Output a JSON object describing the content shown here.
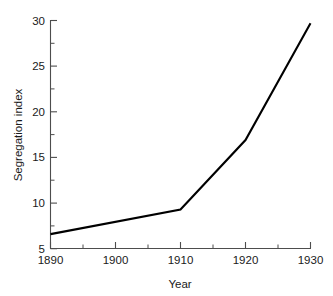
{
  "chart_data": {
    "type": "line",
    "title": "",
    "xlabel": "Year",
    "ylabel": "Segregation index",
    "x": [
      1890,
      1900,
      1910,
      1920,
      1930
    ],
    "series": [
      {
        "name": "Segregation index",
        "x": [
          1890,
          1910,
          1920,
          1930
        ],
        "values": [
          6.6,
          9.3,
          16.9,
          29.7
        ],
        "color": "#000000"
      }
    ],
    "xlim": [
      1890,
      1930
    ],
    "ylim": [
      5,
      30
    ],
    "xticks": [
      1890,
      1900,
      1910,
      1920,
      1930
    ],
    "yticks": [
      5,
      10,
      15,
      20,
      25,
      30
    ],
    "xtick_labels": [
      "1890",
      "1900",
      "1910",
      "1920",
      "1930"
    ],
    "ytick_labels": [
      "5",
      "10",
      "15",
      "20",
      "25",
      "30"
    ],
    "x_minor_ticks": [
      1895,
      1905,
      1915,
      1925
    ],
    "y_minor_ticks": [
      7.5,
      12.5,
      17.5,
      22.5,
      27.5
    ],
    "grid": false,
    "legend": null,
    "legend_position": "none",
    "spines": [
      "left",
      "bottom"
    ],
    "annotations": []
  },
  "axes": {
    "x_title": "Year",
    "y_title": "Segregation index"
  }
}
